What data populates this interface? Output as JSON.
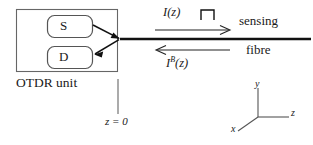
{
  "diagram": {
    "unit": {
      "label": "OTDR unit",
      "components": [
        {
          "id": "source",
          "label": "S",
          "name": "source-box"
        },
        {
          "id": "detector",
          "label": "D",
          "name": "detector-box"
        }
      ]
    },
    "fibre": {
      "upper_label": "sensing",
      "lower_label": "fibre"
    },
    "signals": {
      "forward": {
        "label": "I(z)",
        "direction": "right",
        "waveform": "square-pulse"
      },
      "backscatter": {
        "label_base": "I",
        "label_superscript": "B",
        "label_arg": "(z)",
        "direction": "left"
      }
    },
    "origin_marker": {
      "label": "z = 0"
    },
    "axes": {
      "y": "y",
      "z": "z",
      "x": "x"
    },
    "colors": {
      "stroke": "#1a1a1a",
      "box_stroke": "#555555",
      "background": "#ffffff"
    }
  }
}
